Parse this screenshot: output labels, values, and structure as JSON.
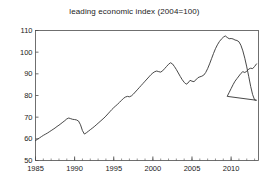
{
  "chart_data": {
    "type": "line",
    "title": "leading economic index (2004=100)",
    "xlabel": "",
    "ylabel": "",
    "xlim": [
      1985,
      2013.5
    ],
    "ylim": [
      50,
      110
    ],
    "yticks": [
      50,
      60,
      70,
      80,
      90,
      100,
      110
    ],
    "ytick_labels": [
      "50",
      "60",
      "70",
      "80",
      "90",
      "100",
      "110"
    ],
    "xticks": [
      1985,
      1990,
      1995,
      2000,
      2005,
      2010
    ],
    "xtick_labels": [
      "1985",
      "1990",
      "1995",
      "2000",
      "2005",
      "2010"
    ],
    "x_minor_tick_step": 1,
    "grid": false,
    "legend": null,
    "line_color": "#333333",
    "series": [
      {
        "name": "leading economic index",
        "x": [
          1985.0,
          1985.25,
          1985.5,
          1985.75,
          1986.0,
          1986.25,
          1986.5,
          1986.75,
          1987.0,
          1987.25,
          1987.5,
          1987.75,
          1988.0,
          1988.25,
          1988.5,
          1988.75,
          1989.0,
          1989.25,
          1989.5,
          1989.75,
          1990.0,
          1990.25,
          1990.5,
          1990.75,
          1991.0,
          1991.25,
          1991.5,
          1991.75,
          1992.0,
          1992.25,
          1992.5,
          1992.75,
          1993.0,
          1993.25,
          1993.5,
          1993.75,
          1994.0,
          1994.25,
          1994.5,
          1994.75,
          1995.0,
          1995.25,
          1995.5,
          1995.75,
          1996.0,
          1996.25,
          1996.5,
          1996.75,
          1997.0,
          1997.25,
          1997.5,
          1997.75,
          1998.0,
          1998.25,
          1998.5,
          1998.75,
          1999.0,
          1999.25,
          1999.5,
          1999.75,
          2000.0,
          2000.25,
          2000.5,
          2000.75,
          2001.0,
          2001.25,
          2001.5,
          2001.75,
          2002.0,
          2002.25,
          2002.5,
          2002.75,
          2003.0,
          2003.25,
          2003.5,
          2003.75,
          2004.0,
          2004.25,
          2004.5,
          2004.75,
          2005.0,
          2005.25,
          2005.5,
          2005.75,
          2006.0,
          2006.25,
          2006.5,
          2006.75,
          2007.0,
          2007.25,
          2007.5,
          2007.75,
          2008.0,
          2008.25,
          2008.5,
          2008.75,
          2009.0,
          2009.25,
          2009.5,
          2009.75,
          2010.0,
          2010.25,
          2010.5,
          2010.75,
          2011.0,
          2011.25,
          2011.5,
          2011.75,
          2012.0,
          2012.25,
          2012.5,
          2012.75,
          2013.0,
          2013.25
        ],
        "values": [
          59.2,
          59.8,
          60.4,
          61.0,
          61.6,
          62.1,
          62.6,
          63.2,
          63.8,
          64.4,
          65.0,
          65.7,
          66.3,
          67.0,
          67.7,
          68.4,
          69.2,
          69.6,
          69.3,
          69.0,
          68.9,
          68.7,
          68.2,
          66.5,
          63.8,
          62.2,
          62.8,
          63.5,
          64.2,
          64.9,
          65.6,
          66.4,
          67.2,
          68.0,
          68.8,
          69.6,
          70.5,
          71.5,
          72.5,
          73.5,
          74.4,
          75.2,
          76.0,
          76.9,
          77.8,
          78.7,
          79.3,
          79.6,
          79.4,
          79.8,
          80.6,
          81.6,
          82.6,
          83.6,
          84.6,
          85.6,
          86.6,
          87.6,
          88.6,
          89.6,
          90.4,
          91.0,
          91.3,
          91.0,
          90.8,
          91.4,
          92.4,
          93.4,
          94.4,
          95.1,
          94.6,
          93.4,
          92.0,
          90.4,
          88.8,
          87.3,
          86.1,
          85.2,
          85.8,
          87.0,
          86.6,
          86.4,
          87.2,
          88.2,
          88.6,
          88.9,
          89.4,
          90.6,
          92.4,
          94.6,
          97.0,
          99.4,
          101.6,
          103.4,
          104.9,
          106.0,
          106.9,
          107.5,
          106.8,
          106.2,
          106.3,
          106.1,
          105.6,
          105.4,
          104.8,
          103.2,
          100.6,
          97.2,
          93.2,
          88.8,
          84.2,
          80.4,
          78.0,
          77.8
        ],
        "values_note": "Continuation after 2009 trough is appended below as recovery segment"
      }
    ],
    "recovery_series": {
      "name": "leading economic index (2009-2013 recovery)",
      "x": [
        2009.25,
        2009.5,
        2009.75,
        2010.0,
        2010.25,
        2010.5,
        2010.75,
        2011.0,
        2011.25,
        2011.5,
        2011.75,
        2012.0,
        2012.25,
        2012.5,
        2012.75,
        2013.0,
        2013.25
      ],
      "values": [
        77.8,
        79.6,
        81.4,
        83.2,
        85.0,
        86.6,
        87.8,
        89.0,
        90.2,
        91.0,
        90.6,
        91.2,
        92.2,
        92.6,
        92.4,
        93.4,
        94.6
      ]
    }
  }
}
